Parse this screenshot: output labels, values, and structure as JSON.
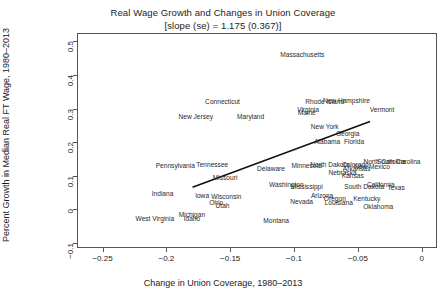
{
  "chart_data": {
    "type": "scatter",
    "title": "Real Wage Growth and Changes in Union Coverage",
    "subtitle": "[slope (se) = 1.175 (0.367)]",
    "xlabel": "Change in Union Coverage, 1980–2013",
    "ylabel": "Percent Growth in Median Real FT Wage, 1980–2013",
    "xlim": [
      -0.27,
      0.012
    ],
    "ylim": [
      -0.115,
      0.525
    ],
    "xticks": [
      -0.25,
      -0.2,
      -0.15,
      -0.1,
      -0.05,
      0
    ],
    "xticklabels": [
      "−0.25",
      "−0.2",
      "−0.15",
      "−0.1",
      "−0.05",
      "0"
    ],
    "yticks": [
      -0.1,
      0,
      0.1,
      0.2,
      0.3,
      0.4,
      0.5
    ],
    "yticklabels": [
      "−0.1",
      "0",
      "0.1",
      "0.2",
      "0.3",
      "0.4",
      "0.5"
    ],
    "grid": false,
    "legend": "none",
    "slope": 1.175,
    "slope_se": 0.367,
    "fit_line": {
      "x0": -0.1795,
      "y0": 0.0655,
      "x1": -0.0405,
      "y1": 0.2615
    },
    "points": [
      {
        "label": "Massachusetts",
        "x": -0.0935,
        "y": 0.46
      },
      {
        "label": "Connecticut",
        "x": -0.156,
        "y": 0.319
      },
      {
        "label": "Rhode Island",
        "x": -0.076,
        "y": 0.319
      },
      {
        "label": "New Hampshire",
        "x": -0.059,
        "y": 0.323
      },
      {
        "label": "Vermont",
        "x": -0.031,
        "y": 0.296
      },
      {
        "label": "Virginia",
        "x": -0.089,
        "y": 0.296
      },
      {
        "label": "Maine",
        "x": -0.09,
        "y": 0.286
      },
      {
        "label": "New Jersey",
        "x": -0.177,
        "y": 0.276
      },
      {
        "label": "Maryland",
        "x": -0.134,
        "y": 0.276
      },
      {
        "label": "New York",
        "x": -0.076,
        "y": 0.244
      },
      {
        "label": "Georgia",
        "x": -0.058,
        "y": 0.223
      },
      {
        "label": "Alabama",
        "x": -0.074,
        "y": 0.202
      },
      {
        "label": "Florida",
        "x": -0.053,
        "y": 0.202
      },
      {
        "label": "Pennsylvania",
        "x": -0.193,
        "y": 0.129
      },
      {
        "label": "Tennessee",
        "x": -0.164,
        "y": 0.133
      },
      {
        "label": "Delaware",
        "x": -0.118,
        "y": 0.119
      },
      {
        "label": "Minnesota",
        "x": -0.09,
        "y": 0.129
      },
      {
        "label": "North Dakota",
        "x": -0.072,
        "y": 0.133
      },
      {
        "label": "Colorado",
        "x": -0.052,
        "y": 0.133
      },
      {
        "label": "New Mexico",
        "x": -0.039,
        "y": 0.125
      },
      {
        "label": "Arkansas",
        "x": -0.051,
        "y": 0.119
      },
      {
        "label": "Nebraska",
        "x": -0.062,
        "y": 0.109
      },
      {
        "label": "Kansas",
        "x": -0.054,
        "y": 0.099
      },
      {
        "label": "North Carolina",
        "x": -0.029,
        "y": 0.14
      },
      {
        "label": "South Carolina",
        "x": -0.018,
        "y": 0.14
      },
      {
        "label": "Missouri",
        "x": -0.154,
        "y": 0.093
      },
      {
        "label": "Indiana",
        "x": -0.203,
        "y": 0.045
      },
      {
        "label": "Washington",
        "x": -0.106,
        "y": 0.072
      },
      {
        "label": "Mississippi",
        "x": -0.09,
        "y": 0.068
      },
      {
        "label": "South Dakota",
        "x": -0.045,
        "y": 0.068
      },
      {
        "label": "California",
        "x": -0.032,
        "y": 0.072
      },
      {
        "label": "Texas",
        "x": -0.02,
        "y": 0.064
      },
      {
        "label": "Iowa",
        "x": -0.172,
        "y": 0.04
      },
      {
        "label": "Wisconsin",
        "x": -0.153,
        "y": 0.037
      },
      {
        "label": "Arizona",
        "x": -0.078,
        "y": 0.04
      },
      {
        "label": "Oregon",
        "x": -0.068,
        "y": 0.031
      },
      {
        "label": "Kentucky",
        "x": -0.043,
        "y": 0.031
      },
      {
        "label": "Nevada",
        "x": -0.094,
        "y": 0.023
      },
      {
        "label": "Louisiana",
        "x": -0.065,
        "y": 0.018
      },
      {
        "label": "Ohio",
        "x": -0.161,
        "y": 0.018
      },
      {
        "label": "Utah",
        "x": -0.156,
        "y": 0.01
      },
      {
        "label": "Oklahoma",
        "x": -0.034,
        "y": 0.006
      },
      {
        "label": "Michigan",
        "x": -0.18,
        "y": -0.018
      },
      {
        "label": "West Virginia",
        "x": -0.209,
        "y": -0.028
      },
      {
        "label": "Idaho",
        "x": -0.18,
        "y": -0.028
      },
      {
        "label": "Montana",
        "x": -0.114,
        "y": -0.035
      }
    ]
  }
}
